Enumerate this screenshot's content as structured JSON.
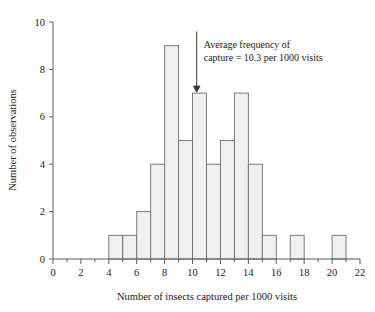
{
  "chart_data": {
    "type": "bar",
    "title": "",
    "subtitle": "",
    "xlabel": "Number of insects captured per 1000 visits",
    "ylabel": "Number of observations",
    "xlim": [
      0,
      22
    ],
    "ylim": [
      0,
      10
    ],
    "grid": false,
    "legend": null,
    "bin_width": 1,
    "categories": [
      "4",
      "5",
      "6",
      "7",
      "8",
      "9",
      "10",
      "11",
      "12",
      "13",
      "14",
      "15",
      "16",
      "17",
      "18",
      "19",
      "20",
      "21"
    ],
    "bin_starts": [
      4,
      5,
      6,
      7,
      8,
      9,
      10,
      11,
      12,
      13,
      14,
      15,
      16,
      17,
      18,
      19,
      20,
      21
    ],
    "values": [
      1,
      1,
      2,
      4,
      9,
      5,
      7,
      4,
      5,
      7,
      4,
      1,
      0,
      1,
      0,
      0,
      1,
      0
    ],
    "x_ticks": [
      "0",
      "2",
      "4",
      "6",
      "8",
      "10",
      "12",
      "14",
      "16",
      "18",
      "20",
      "22"
    ],
    "x_tick_values": [
      0,
      2,
      4,
      6,
      8,
      10,
      12,
      14,
      16,
      18,
      20,
      22
    ],
    "x_minor_tick_values": [
      1,
      3,
      5,
      7,
      9,
      11,
      13,
      15,
      17,
      19,
      21
    ],
    "y_ticks": [
      "0",
      "2",
      "4",
      "6",
      "8",
      "10"
    ],
    "y_tick_values": [
      0,
      2,
      4,
      6,
      8,
      10
    ],
    "annotations": [
      {
        "name": "mean-marker",
        "text_line1": "Average frequency of",
        "text_line2": "capture = 10.3 per 1000 visits",
        "value": 10.3,
        "points_to_y": 7
      }
    ],
    "colors": {
      "bar_fill": "#f0f0ee",
      "bar_stroke": "#6e6e6e",
      "axis": "#5a5a5a",
      "text": "#1a1a1a",
      "annotation": "#3a3a3a",
      "background": "#ffffff"
    }
  }
}
